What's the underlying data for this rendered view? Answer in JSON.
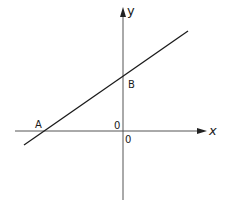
{
  "diagram": {
    "type": "coordinate-graph",
    "axes": {
      "x_label": "x",
      "y_label": "y",
      "origin_labels": [
        "0",
        "0"
      ],
      "color": "#555555"
    },
    "line": {
      "color": "#1a1a1a",
      "description": "straight line with positive slope crossing x-axis at A and y-axis at B"
    },
    "points": [
      {
        "label": "A",
        "location": "x-intercept"
      },
      {
        "label": "B",
        "location": "y-intercept"
      }
    ]
  }
}
